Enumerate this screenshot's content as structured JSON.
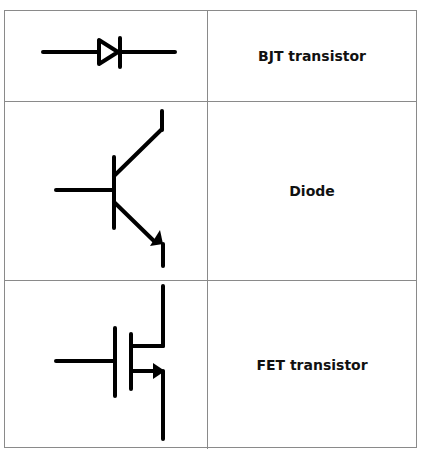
{
  "heading_partial": "... pairing symbols ...",
  "table": {
    "rows": [
      {
        "symbol": "diode-symbol",
        "label": "BJT transistor"
      },
      {
        "symbol": "bjt-npn-symbol",
        "label": "Diode"
      },
      {
        "symbol": "fet-symbol",
        "label": "FET transistor"
      }
    ]
  },
  "colors": {
    "stroke": "#000000",
    "border": "#8a8a8a",
    "background": "#ffffff"
  }
}
